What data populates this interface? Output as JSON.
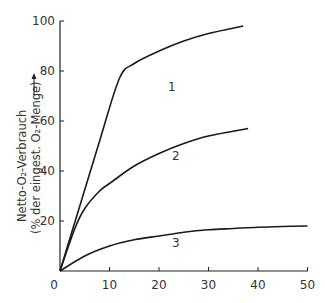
{
  "chart_data": {
    "type": "line",
    "title": "",
    "xlabel": "",
    "ylabel_line1": "Netto-O₂-Verbrauch",
    "ylabel_line2": "(% der eingest. O₂-Menge)",
    "xlim": [
      0,
      50
    ],
    "ylim": [
      0,
      100
    ],
    "xticks": [
      "0",
      "10",
      "20",
      "30",
      "40",
      "50"
    ],
    "yticks": [
      "20",
      "40",
      "60",
      "80",
      "100"
    ],
    "grid": false,
    "legend": "inline curve labels",
    "series": [
      {
        "name": "1",
        "x": [
          0,
          4,
          8,
          12,
          15,
          20,
          25,
          30,
          37
        ],
        "y": [
          0,
          26,
          52,
          77,
          83,
          88,
          92,
          95,
          98
        ]
      },
      {
        "name": "2",
        "x": [
          0,
          3,
          5,
          8,
          10,
          15,
          20,
          25,
          30,
          38
        ],
        "y": [
          0,
          17,
          25,
          32,
          35,
          42,
          47,
          51,
          54,
          57
        ]
      },
      {
        "name": "3",
        "x": [
          0,
          5,
          10,
          15,
          20,
          25,
          30,
          35,
          40,
          45,
          50
        ],
        "y": [
          0,
          6,
          10,
          12.5,
          14,
          15.5,
          16.5,
          17,
          17.5,
          17.8,
          18
        ]
      }
    ]
  }
}
